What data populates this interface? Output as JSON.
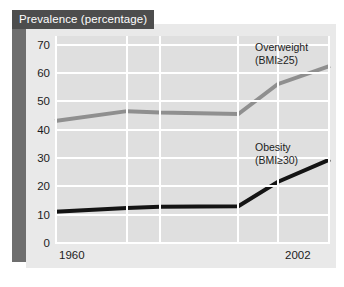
{
  "chart_data": {
    "type": "line",
    "title": "Prevalence (percentage)",
    "xlabel": "",
    "ylabel": "",
    "grid": true,
    "legend_position": "inline-right",
    "x": [
      1960,
      1971,
      1976,
      1988,
      1994,
      2002
    ],
    "xlim": [
      1960,
      2002
    ],
    "ylim": [
      0,
      73
    ],
    "yticks": [
      70,
      60,
      50,
      40,
      30,
      20,
      10,
      0
    ],
    "xticks": [
      "1960",
      "2002"
    ],
    "xtick_values": [
      1960,
      2002
    ],
    "series": [
      {
        "name": "Overweight (BMI≥25)",
        "label_line1": "Overweight",
        "label_line2": "(BMI≥25)",
        "color": "#8f8f8f",
        "values": [
          43.0,
          46.5,
          46.0,
          45.5,
          56.0,
          62.5
        ]
      },
      {
        "name": "Obesity (BMI≥30)",
        "label_line1": "Obesity",
        "label_line2": "(BMI≥30)",
        "color": "#141414",
        "values": [
          11.0,
          12.3,
          12.8,
          13.0,
          21.5,
          29.5
        ]
      }
    ]
  },
  "colors": {
    "title_band": "#4d4d4d",
    "side_band": "#6e6e6e",
    "panel": "#e9e9e9",
    "plot_background": "#dfdfdf",
    "gridline": "#ffffff",
    "overweight": "#8f8f8f",
    "obesity": "#141414",
    "text": "#1c1c1c"
  }
}
